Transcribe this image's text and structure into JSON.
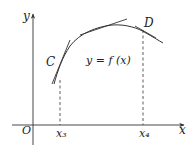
{
  "diagram": {
    "title": "",
    "axes": {
      "x_label": "x",
      "y_label": "y",
      "origin_label": "O"
    },
    "curve_label": "y = f (x)",
    "points": [
      {
        "name": "C",
        "label": "C"
      },
      {
        "name": "D",
        "label": "D"
      }
    ],
    "ticks": [
      {
        "label": "x₃"
      },
      {
        "label": "x₄"
      }
    ],
    "colors": {
      "stroke": "#333333",
      "background": "#ffffff"
    }
  }
}
